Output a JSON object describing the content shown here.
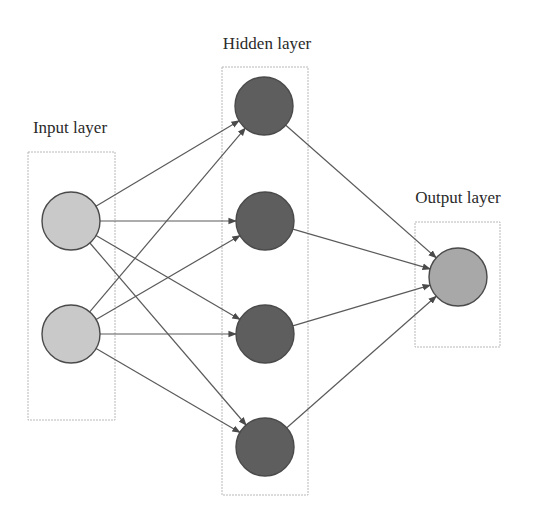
{
  "diagram": {
    "colors": {
      "input_node": "#c9c9c9",
      "hidden_node": "#5e5e5e",
      "output_node": "#a8a8a8",
      "edge": "#5a5a5a",
      "box": "#b8b8b8"
    },
    "layers": [
      {
        "id": "input",
        "label": "Input layer",
        "label_pos": [
          70,
          133
        ],
        "box": {
          "x": 28,
          "y": 152,
          "w": 87,
          "h": 268
        },
        "nodes": [
          {
            "id": "i1",
            "cx": 71,
            "cy": 221,
            "r": 29
          },
          {
            "id": "i2",
            "cx": 71,
            "cy": 334,
            "r": 29
          }
        ]
      },
      {
        "id": "hidden",
        "label": "Hidden layer",
        "label_pos": [
          267,
          49
        ],
        "box": {
          "x": 222,
          "y": 67,
          "w": 86,
          "h": 428
        },
        "nodes": [
          {
            "id": "h1",
            "cx": 264,
            "cy": 106,
            "r": 29
          },
          {
            "id": "h2",
            "cx": 265,
            "cy": 221,
            "r": 29
          },
          {
            "id": "h3",
            "cx": 265,
            "cy": 334,
            "r": 29
          },
          {
            "id": "h4",
            "cx": 265,
            "cy": 447,
            "r": 29
          }
        ]
      },
      {
        "id": "output",
        "label": "Output layer",
        "label_pos": [
          458,
          203
        ],
        "box": {
          "x": 415,
          "y": 222,
          "w": 85,
          "h": 125
        },
        "nodes": [
          {
            "id": "o1",
            "cx": 458,
            "cy": 277,
            "r": 29
          }
        ]
      }
    ],
    "edges": [
      {
        "from": "i1",
        "to": "h1"
      },
      {
        "from": "i1",
        "to": "h2"
      },
      {
        "from": "i1",
        "to": "h3"
      },
      {
        "from": "i1",
        "to": "h4"
      },
      {
        "from": "i2",
        "to": "h1"
      },
      {
        "from": "i2",
        "to": "h2"
      },
      {
        "from": "i2",
        "to": "h3"
      },
      {
        "from": "i2",
        "to": "h4"
      },
      {
        "from": "h1",
        "to": "o1"
      },
      {
        "from": "h2",
        "to": "o1"
      },
      {
        "from": "h3",
        "to": "o1"
      },
      {
        "from": "h4",
        "to": "o1"
      }
    ]
  }
}
